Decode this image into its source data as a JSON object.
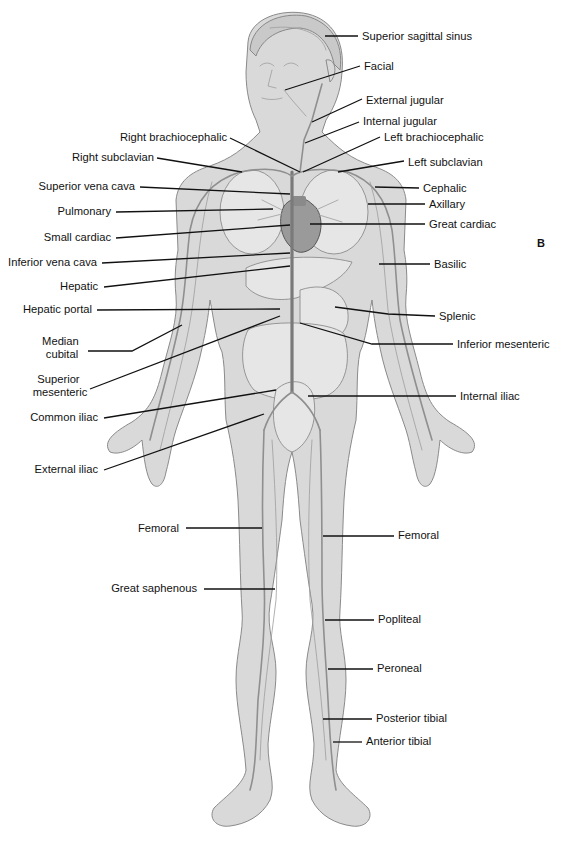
{
  "figure": {
    "panel_letter": "B"
  },
  "labels_left": [
    {
      "id": "right-brachiocephalic",
      "text": "Right  brachiocephalic",
      "x": 227,
      "y": 141,
      "line": [
        230,
        138,
        300,
        172
      ]
    },
    {
      "id": "right-subclavian",
      "text": "Right subclavian",
      "x": 154,
      "y": 161,
      "line": [
        157,
        158,
        242,
        172
      ]
    },
    {
      "id": "superior-vena-cava",
      "text": "Superior vena cava",
      "x": 135,
      "y": 190,
      "line": [
        140,
        187,
        290,
        194
      ]
    },
    {
      "id": "pulmonary",
      "text": "Pulmonary",
      "x": 111,
      "y": 215,
      "line": [
        116,
        212,
        273,
        209
      ]
    },
    {
      "id": "small-cardiac",
      "text": "Small cardiac",
      "x": 111,
      "y": 241,
      "line": [
        116,
        238,
        290,
        225
      ]
    },
    {
      "id": "inferior-vena-cava",
      "text": "Inferior vena cava",
      "x": 97,
      "y": 266,
      "line": [
        102,
        263,
        290,
        253
      ]
    },
    {
      "id": "hepatic",
      "text": "Hepatic",
      "x": 98,
      "y": 290,
      "line": [
        104,
        287,
        290,
        266
      ]
    },
    {
      "id": "hepatic-portal",
      "text": "Hepatic portal",
      "x": 92,
      "y": 313,
      "line": [
        97,
        310,
        280,
        309
      ]
    },
    {
      "id": "median-cubital",
      "text": "Median\ncubital",
      "x": 80,
      "y": 345,
      "line": [
        88,
        351,
        132,
        351,
        182,
        325
      ]
    },
    {
      "id": "superior-mesenteric",
      "text": "Superior\nmesenteric",
      "x": 86,
      "y": 383,
      "line": [
        90,
        389,
        280,
        316
      ]
    },
    {
      "id": "common-iliac",
      "text": "Common iliac",
      "x": 98,
      "y": 421,
      "line": [
        104,
        418,
        276,
        390
      ]
    },
    {
      "id": "external-iliac",
      "text": "External iliac",
      "x": 98,
      "y": 473,
      "line": [
        104,
        470,
        264,
        414
      ]
    },
    {
      "id": "femoral-right",
      "text": "Femoral",
      "x": 179,
      "y": 532,
      "line": [
        186,
        528,
        262,
        528
      ]
    },
    {
      "id": "great-saphenous",
      "text": "Great saphenous",
      "x": 197,
      "y": 592,
      "line": [
        204,
        589,
        275,
        589
      ]
    }
  ],
  "labels_right": [
    {
      "id": "superior-sagittal-sinus",
      "text": "Superior sagittal sinus",
      "x": 362,
      "y": 40,
      "line": [
        358,
        36,
        325,
        36
      ]
    },
    {
      "id": "facial",
      "text": "Facial",
      "x": 364,
      "y": 70,
      "line": [
        360,
        66,
        285,
        90
      ]
    },
    {
      "id": "external-jugular",
      "text": "External jugular",
      "x": 366,
      "y": 104,
      "line": [
        362,
        99,
        312,
        122
      ]
    },
    {
      "id": "internal-jugular",
      "text": "Internal jugular",
      "x": 363,
      "y": 125,
      "line": [
        359,
        122,
        305,
        143
      ]
    },
    {
      "id": "left-brachiocephalic",
      "text": "Left brachiocephalic",
      "x": 384,
      "y": 141,
      "line": [
        380,
        137,
        303,
        172
      ]
    },
    {
      "id": "left-subclavian",
      "text": "Left subclavian",
      "x": 408,
      "y": 166,
      "line": [
        404,
        161,
        338,
        172
      ]
    },
    {
      "id": "cephalic",
      "text": "Cephalic",
      "x": 423,
      "y": 192,
      "line": [
        419,
        188,
        375,
        187
      ]
    },
    {
      "id": "axillary",
      "text": "Axillary",
      "x": 429,
      "y": 208,
      "line": [
        425,
        204,
        368,
        204
      ]
    },
    {
      "id": "great-cardiac",
      "text": "Great cardiac",
      "x": 429,
      "y": 228,
      "line": [
        425,
        224,
        310,
        224
      ]
    },
    {
      "id": "basilic",
      "text": "Basilic",
      "x": 434,
      "y": 268,
      "line": [
        430,
        264,
        379,
        264
      ]
    },
    {
      "id": "splenic",
      "text": "Splenic",
      "x": 439,
      "y": 320,
      "line": [
        435,
        316,
        388,
        314,
        335,
        307
      ]
    },
    {
      "id": "inferior-mesenteric",
      "text": "Inferior mesenteric",
      "x": 457,
      "y": 348,
      "line": [
        453,
        344,
        372,
        344,
        300,
        323
      ]
    },
    {
      "id": "internal-iliac",
      "text": "Internal iliac",
      "x": 460,
      "y": 400,
      "line": [
        456,
        396,
        308,
        396
      ]
    },
    {
      "id": "femoral-left",
      "text": "Femoral",
      "x": 398,
      "y": 539,
      "line": [
        394,
        536,
        323,
        536
      ]
    },
    {
      "id": "popliteal",
      "text": "Popliteal",
      "x": 378,
      "y": 623,
      "line": [
        374,
        620,
        325,
        620
      ]
    },
    {
      "id": "peroneal",
      "text": "Peroneal",
      "x": 377,
      "y": 672,
      "line": [
        373,
        669,
        328,
        669
      ]
    },
    {
      "id": "posterior-tibial",
      "text": "Posterior tibial",
      "x": 376,
      "y": 722,
      "line": [
        372,
        719,
        323,
        719
      ]
    },
    {
      "id": "anterior-tibial",
      "text": "Anterior tibial",
      "x": 366,
      "y": 745,
      "line": [
        362,
        742,
        333,
        742
      ]
    }
  ],
  "colors": {
    "background": "#ffffff",
    "label_text": "#111111",
    "leader_line": "#111111",
    "skin": "#d9d9d9",
    "vein": "#8f8f8f"
  }
}
